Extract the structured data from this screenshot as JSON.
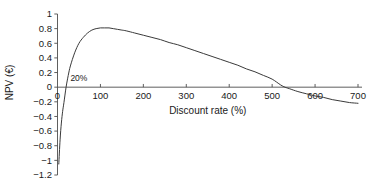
{
  "chart_data": {
    "type": "line",
    "title": "",
    "subtitle": "",
    "xlabel": "Discount rate (%)",
    "ylabel": "NPV (€)",
    "xlim": [
      0,
      700
    ],
    "ylim": [
      -1.2,
      1.0
    ],
    "grid": false,
    "legend": false,
    "legend_position": "none",
    "xticks": [
      0,
      100,
      200,
      300,
      400,
      500,
      600,
      700
    ],
    "xtick_labels": [
      "0",
      "100",
      "200",
      "300",
      "400",
      "500",
      "600",
      "700"
    ],
    "yticks": [
      -1.2,
      -1.0,
      -0.8,
      -0.6,
      -0.4,
      -0.2,
      0,
      0.2,
      0.4,
      0.6,
      0.8,
      1.0
    ],
    "ytick_labels": [
      "−1.2",
      "−1",
      "−0.8",
      "−0.6",
      "−0.4",
      "−0.2",
      "0",
      "0.2",
      "0.4",
      "0.6",
      "0.8",
      "1"
    ],
    "annotations": [
      {
        "text": "20%",
        "x": 30,
        "y": 0.06,
        "note": "internal rate of return, first zero crossing of the NPV curve"
      }
    ],
    "series": [
      {
        "name": "NPV profile",
        "color": "#3a3a3a",
        "x": [
          3,
          6,
          9,
          12,
          15,
          20,
          25,
          30,
          40,
          50,
          60,
          70,
          80,
          90,
          100,
          110,
          120,
          130,
          140,
          150,
          160,
          180,
          200,
          220,
          240,
          260,
          280,
          300,
          320,
          340,
          360,
          380,
          400,
          420,
          440,
          460,
          480,
          500,
          520,
          530,
          540,
          560,
          580,
          600,
          620,
          640,
          660,
          680,
          700
        ],
        "y": [
          -1.05,
          -0.72,
          -0.49,
          -0.33,
          -0.21,
          0.0,
          0.16,
          0.29,
          0.47,
          0.6,
          0.68,
          0.74,
          0.78,
          0.8,
          0.81,
          0.81,
          0.81,
          0.8,
          0.79,
          0.78,
          0.77,
          0.74,
          0.71,
          0.68,
          0.65,
          0.61,
          0.58,
          0.54,
          0.5,
          0.46,
          0.42,
          0.38,
          0.34,
          0.3,
          0.25,
          0.21,
          0.16,
          0.11,
          0.03,
          0.0,
          -0.02,
          -0.06,
          -0.09,
          -0.12,
          -0.14,
          -0.17,
          -0.19,
          -0.21,
          -0.22
        ]
      }
    ]
  },
  "axes": {
    "y_axis_title": "NPV (€)",
    "x_axis_title": "Discount rate (%)"
  }
}
